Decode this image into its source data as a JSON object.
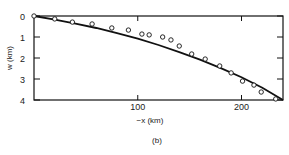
{
  "chart_data": {
    "type": "line",
    "title": "",
    "panel_label": "(b)",
    "xlabel": "−x (km)",
    "ylabel": "w (km)",
    "xlim": [
      0,
      240
    ],
    "ylim": [
      0,
      4
    ],
    "y_inverted": true,
    "x_ticks": [
      {
        "value": 100,
        "label": "100"
      },
      {
        "value": 200,
        "label": "200"
      }
    ],
    "y_ticks": [
      {
        "value": 0,
        "label": "0"
      },
      {
        "value": 1,
        "label": "1"
      },
      {
        "value": 2,
        "label": "2"
      },
      {
        "value": 3,
        "label": "3"
      },
      {
        "value": 4,
        "label": "4"
      }
    ],
    "grid": false,
    "series": [
      {
        "name": "model",
        "style": "solid-line",
        "x": [
          0,
          20,
          40,
          60,
          80,
          100,
          120,
          140,
          160,
          180,
          200,
          220,
          240
        ],
        "y": [
          0,
          0.17,
          0.36,
          0.57,
          0.82,
          1.08,
          1.38,
          1.72,
          2.08,
          2.48,
          2.92,
          3.42,
          4.0
        ]
      },
      {
        "name": "observed",
        "style": "open-circles",
        "x": [
          0,
          20,
          37,
          56,
          75,
          91,
          104,
          111,
          124,
          132,
          140,
          152,
          165,
          179,
          190,
          201,
          212,
          219,
          233
        ],
        "y": [
          0,
          0.14,
          0.29,
          0.38,
          0.57,
          0.67,
          0.86,
          0.9,
          1.0,
          1.14,
          1.43,
          1.81,
          2.05,
          2.38,
          2.71,
          3.1,
          3.29,
          3.62,
          3.95
        ]
      }
    ]
  }
}
